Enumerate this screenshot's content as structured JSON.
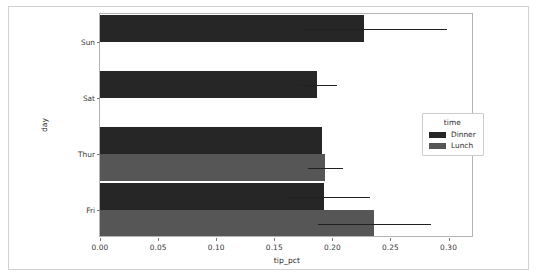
{
  "chart_data": {
    "type": "bar",
    "orientation": "horizontal",
    "title": "",
    "xlabel": "tip_pct",
    "ylabel": "day",
    "categories": [
      "Sun",
      "Sat",
      "Thur",
      "Fri"
    ],
    "xlim": [
      0.0,
      0.3219
    ],
    "xticks": [
      0.0,
      0.05,
      0.1,
      0.15,
      0.2,
      0.25,
      0.3
    ],
    "xtick_labels": [
      "0.00",
      "0.05",
      "0.10",
      "0.15",
      "0.20",
      "0.25",
      "0.30"
    ],
    "grid": false,
    "legend": {
      "title": "time",
      "position": "center right",
      "entries": [
        {
          "label": "Dinner",
          "color": "#262626"
        },
        {
          "label": "Lunch",
          "color": "#565656"
        }
      ]
    },
    "series": [
      {
        "name": "Dinner",
        "color": "#262626",
        "values": [
          0.227,
          0.187,
          0.191,
          0.193
        ],
        "ci_low": [
          0.175,
          0.172,
          null,
          0.159
        ],
        "ci_high": [
          0.299,
          0.204,
          null,
          0.232
        ]
      },
      {
        "name": "Lunch",
        "color": "#565656",
        "values": [
          null,
          null,
          0.194,
          0.236
        ],
        "ci_low": [
          null,
          null,
          0.179,
          0.188
        ],
        "ci_high": [
          null,
          null,
          0.209,
          0.285
        ]
      }
    ],
    "bars": [
      {
        "day": "Sun",
        "time": "Dinner",
        "value": 0.227,
        "ci_low": 0.175,
        "ci_high": 0.299
      },
      {
        "day": "Sat",
        "time": "Dinner",
        "value": 0.187,
        "ci_low": 0.172,
        "ci_high": 0.204
      },
      {
        "day": "Thur",
        "time": "Dinner",
        "value": 0.191,
        "ci_low": null,
        "ci_high": null
      },
      {
        "day": "Thur",
        "time": "Lunch",
        "value": 0.194,
        "ci_low": 0.179,
        "ci_high": 0.209
      },
      {
        "day": "Fri",
        "time": "Dinner",
        "value": 0.193,
        "ci_low": 0.159,
        "ci_high": 0.232
      },
      {
        "day": "Fri",
        "time": "Lunch",
        "value": 0.236,
        "ci_low": 0.188,
        "ci_high": 0.285
      }
    ]
  },
  "axes": {
    "xlabel": "tip_pct",
    "ylabel": "day",
    "xtick_labels": [
      "0.00",
      "0.05",
      "0.10",
      "0.15",
      "0.20",
      "0.25",
      "0.30"
    ],
    "ytick_labels": [
      "Sun",
      "Sat",
      "Thur",
      "Fri"
    ]
  },
  "legend": {
    "title": "time",
    "dinner_label": "Dinner",
    "lunch_label": "Lunch"
  },
  "colors": {
    "dinner": "#262626",
    "lunch": "#565656",
    "spine": "#b4b4b4",
    "figure_border": "#d2d2d2",
    "text": "#2e2e2e",
    "background": "#ffffff"
  }
}
